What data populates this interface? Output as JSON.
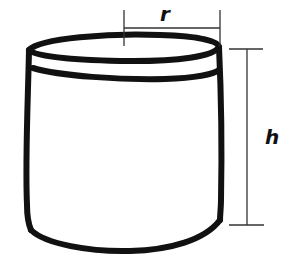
{
  "diagram": {
    "labels": {
      "radius": "r",
      "height": "h"
    },
    "colors": {
      "stroke": "#111111",
      "dimension_line": "#333333",
      "background": "#ffffff"
    }
  }
}
